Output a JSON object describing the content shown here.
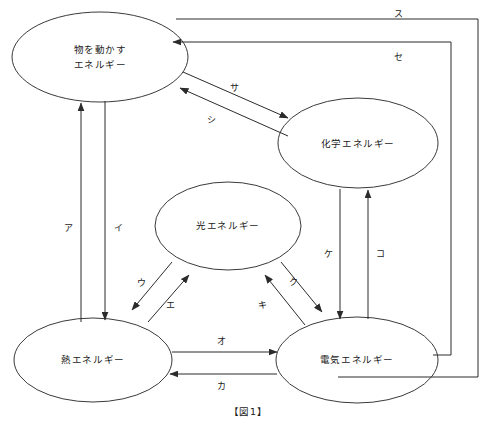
{
  "figure": {
    "caption": "【図1】",
    "background_color": "#ffffff",
    "line_color": "#2b2b2b",
    "text_color": "#1a1a1a"
  },
  "nodes": [
    {
      "id": "motion",
      "label_line1": "物を動かす",
      "label_line2": "エネルギー",
      "cx": 100,
      "cy": 57,
      "rx": 88,
      "ry": 45
    },
    {
      "id": "chemical",
      "label_line1": "化学エネルギー",
      "label_line2": "",
      "cx": 358,
      "cy": 143,
      "rx": 80,
      "ry": 45
    },
    {
      "id": "light",
      "label_line1": "光エネルギー",
      "label_line2": "",
      "cx": 228,
      "cy": 226,
      "rx": 73,
      "ry": 44
    },
    {
      "id": "heat",
      "label_line1": "熱エネルギー",
      "label_line2": "",
      "cx": 93,
      "cy": 360,
      "rx": 79,
      "ry": 42
    },
    {
      "id": "electric",
      "label_line1": "電気エネルギー",
      "label_line2": "",
      "cx": 357,
      "cy": 360,
      "rx": 81,
      "ry": 43
    }
  ],
  "edges": [
    {
      "id": "a",
      "label": "ア",
      "from": "heat",
      "to": "motion",
      "label_x": 68,
      "label_y": 228
    },
    {
      "id": "i",
      "label": "イ",
      "from": "motion",
      "to": "heat",
      "label_x": 118,
      "label_y": 228
    },
    {
      "id": "u",
      "label": "ウ",
      "from": "light",
      "to": "heat",
      "label_x": 141,
      "label_y": 283
    },
    {
      "id": "e",
      "label": "エ",
      "from": "heat",
      "to": "light",
      "label_x": 170,
      "label_y": 305
    },
    {
      "id": "o",
      "label": "オ",
      "from": "heat",
      "to": "electric",
      "label_x": 221,
      "label_y": 341
    },
    {
      "id": "ka",
      "label": "カ",
      "from": "electric",
      "to": "heat",
      "label_x": 221,
      "label_y": 386
    },
    {
      "id": "ki",
      "label": "キ",
      "from": "electric",
      "to": "light",
      "label_x": 262,
      "label_y": 305
    },
    {
      "id": "ku",
      "label": "ク",
      "from": "light",
      "to": "electric",
      "label_x": 293,
      "label_y": 282
    },
    {
      "id": "ke",
      "label": "ケ",
      "from": "chemical",
      "to": "electric",
      "label_x": 328,
      "label_y": 254
    },
    {
      "id": "ko",
      "label": "コ",
      "from": "electric",
      "to": "chemical",
      "label_x": 380,
      "label_y": 254
    },
    {
      "id": "sa",
      "label": "サ",
      "from": "motion",
      "to": "chemical",
      "label_x": 234,
      "label_y": 88
    },
    {
      "id": "shi",
      "label": "シ",
      "from": "chemical",
      "to": "motion",
      "label_x": 211,
      "label_y": 120
    },
    {
      "id": "su",
      "label": "ス",
      "from": "electric",
      "to": "motion",
      "label_x": 398,
      "label_y": 14
    },
    {
      "id": "se",
      "label": "セ",
      "from": "electric",
      "to": "motion",
      "label_x": 398,
      "label_y": 57
    }
  ]
}
